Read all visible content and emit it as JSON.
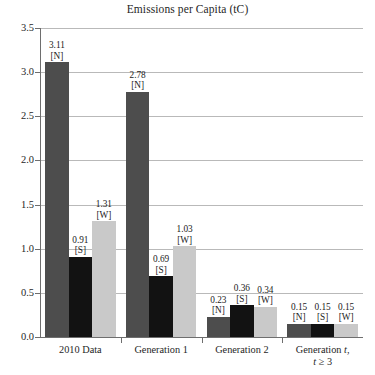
{
  "chart_data": {
    "type": "bar",
    "title": "Emissions per Capita (tC)",
    "xlabel": "",
    "ylabel": "",
    "ylim": [
      0.0,
      3.5
    ],
    "ytick_labels": [
      "0.0",
      "0.5",
      "1.0",
      "1.5",
      "2.0",
      "2.5",
      "3.0",
      "3.5"
    ],
    "ytick_values": [
      0.0,
      0.5,
      1.0,
      1.5,
      2.0,
      2.5,
      3.0,
      3.5
    ],
    "grid": "horizontal",
    "legend": "none",
    "categories": [
      "2010 Data",
      "Generation 1",
      "Generation 2",
      "Generation t, t ≥ 3"
    ],
    "category_labels": [
      {
        "line1": "2010 Data",
        "line2": ""
      },
      {
        "line1": "Generation 1",
        "line2": ""
      },
      {
        "line1": "Generation 2",
        "line2": ""
      },
      {
        "line1": "Generation t,",
        "line2": "t ≥ 3"
      }
    ],
    "series": [
      {
        "name": "N",
        "tag": "[N]",
        "color": "#4d4d4d",
        "values": [
          3.11,
          2.78,
          0.23,
          0.15
        ]
      },
      {
        "name": "S",
        "tag": "[S]",
        "color": "#121212",
        "values": [
          0.91,
          0.69,
          0.36,
          0.15
        ]
      },
      {
        "name": "W",
        "tag": "[W]",
        "color": "#c9c9c9",
        "values": [
          1.31,
          1.03,
          0.34,
          0.15
        ]
      }
    ],
    "data_labels": [
      [
        "3.11",
        "0.91",
        "1.31"
      ],
      [
        "2.78",
        "0.69",
        "1.03"
      ],
      [
        "0.23",
        "0.36",
        "0.34"
      ],
      [
        "0.15",
        "0.15",
        "0.15"
      ]
    ],
    "colors": {
      "north": "#4d4d4d",
      "south": "#121212",
      "world": "#c9c9c9",
      "gridline": "#b9b9b9",
      "axis": "#6e6e6e",
      "text": "#1f1f1f",
      "background": "#ffffff"
    }
  }
}
